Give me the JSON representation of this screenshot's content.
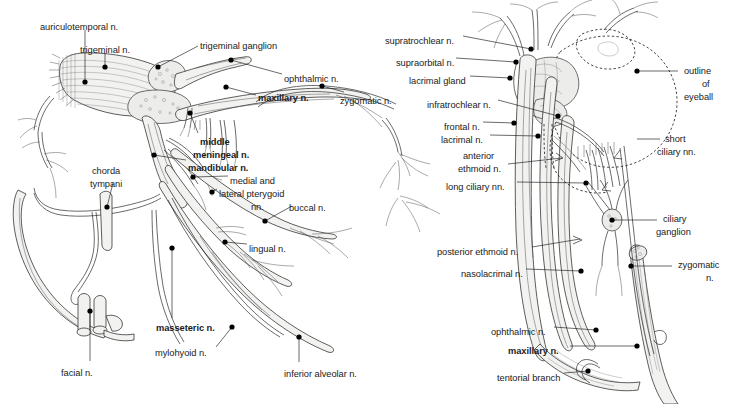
{
  "figure": {
    "background_color": "#ffffff",
    "ink_color": "#1a1a1a",
    "nerve_fill_color": "#f2f2f0",
    "panels": [
      {
        "id": "left",
        "name": "trigeminal-nerve-panel"
      },
      {
        "id": "right",
        "name": "orbit-ophthalmic-panel"
      }
    ]
  },
  "left_panel": {
    "name": "trigeminal-nerve-panel",
    "labels": [
      {
        "id": "auriculotemporal",
        "text": "auriculotemporal n.",
        "bold": false,
        "x": 40,
        "y": 22,
        "align": "left",
        "dot": [
          85,
          82
        ]
      },
      {
        "id": "trigeminal",
        "text": "trigeminal n.",
        "bold": false,
        "x": 80,
        "y": 45,
        "align": "left",
        "dot": [
          105,
          67
        ]
      },
      {
        "id": "trigeminal_gang",
        "text": "trigeminal ganglion",
        "bold": false,
        "x": 200,
        "y": 41,
        "align": "left",
        "dot": [
          158,
          67
        ]
      },
      {
        "id": "ophthalmic_l",
        "text": "ophthalmic n.",
        "bold": false,
        "x": 284,
        "y": 74,
        "align": "left",
        "dot": [
          231,
          60
        ]
      },
      {
        "id": "maxillary_l",
        "text": "maxillary n.",
        "bold": true,
        "x": 258,
        "y": 93,
        "align": "left",
        "dot": [
          226,
          87
        ]
      },
      {
        "id": "zygomatic_l",
        "text": "zygomatic n.",
        "bold": false,
        "x": 340,
        "y": 96,
        "align": "left",
        "dot": [
          322,
          86
        ]
      },
      {
        "id": "middle",
        "text": "middle",
        "bold": true,
        "x": 200,
        "y": 137,
        "align": "left",
        "dot": [
          190,
          113
        ]
      },
      {
        "id": "meningeal",
        "text": "meningeal n.",
        "bold": true,
        "x": 193,
        "y": 150,
        "align": "left",
        "dot": null
      },
      {
        "id": "mandibular",
        "text": "mandibular n.",
        "bold": true,
        "x": 188,
        "y": 163,
        "align": "left",
        "dot": [
          154,
          155
        ]
      },
      {
        "id": "medial_and",
        "text": "medial and",
        "bold": false,
        "x": 230,
        "y": 176,
        "align": "left",
        "dot": [
          193,
          177
        ]
      },
      {
        "id": "lateral_pteryg",
        "text": "lateral pterygoid",
        "bold": false,
        "x": 219,
        "y": 189,
        "align": "left",
        "dot": [
          212,
          192
        ]
      },
      {
        "id": "nn",
        "text": "nn.",
        "bold": false,
        "x": 251,
        "y": 202,
        "align": "left",
        "dot": null
      },
      {
        "id": "buccal",
        "text": "buccal n.",
        "bold": false,
        "x": 289,
        "y": 203,
        "align": "left",
        "dot": [
          265,
          221
        ]
      },
      {
        "id": "chorda",
        "text": "chorda",
        "bold": false,
        "x": 92,
        "y": 166,
        "align": "left",
        "dot": [
          107,
          207
        ]
      },
      {
        "id": "tympani",
        "text": "tympani",
        "bold": false,
        "x": 90,
        "y": 179,
        "align": "left",
        "dot": null
      },
      {
        "id": "lingual",
        "text": "lingual n.",
        "bold": false,
        "x": 249,
        "y": 244,
        "align": "left",
        "dot": [
          225,
          242
        ]
      },
      {
        "id": "masseteric",
        "text": "masseteric n.",
        "bold": true,
        "x": 156,
        "y": 323,
        "align": "left",
        "dot": [
          172,
          248
        ]
      },
      {
        "id": "mylohyoid",
        "text": "mylohyoid n.",
        "bold": false,
        "x": 155,
        "y": 348,
        "align": "left",
        "dot": [
          232,
          327
        ]
      },
      {
        "id": "facial",
        "text": "facial n.",
        "bold": false,
        "x": 61,
        "y": 368,
        "align": "left",
        "dot": [
          90,
          311
        ]
      },
      {
        "id": "inferior_alv",
        "text": "inferior alveolar n.",
        "bold": false,
        "x": 284,
        "y": 369,
        "align": "left",
        "dot": [
          299,
          337
        ]
      }
    ]
  },
  "right_panel": {
    "name": "orbit-ophthalmic-panel",
    "labels": [
      {
        "id": "supratrochlear",
        "text": "supratrochlear n.",
        "bold": false,
        "x": 385,
        "y": 36,
        "align": "left",
        "dot": [
          531,
          49
        ]
      },
      {
        "id": "supraorbital",
        "text": "supraorbital n.",
        "bold": false,
        "x": 396,
        "y": 58,
        "align": "left",
        "dot": [
          516,
          62
        ]
      },
      {
        "id": "lacrimal_gland",
        "text": "lacrimal gland",
        "bold": false,
        "x": 409,
        "y": 76,
        "align": "left",
        "dot": [
          510,
          78
        ]
      },
      {
        "id": "infratrochlear",
        "text": "infratrochlear n.",
        "bold": false,
        "x": 427,
        "y": 100,
        "align": "left",
        "dot": [
          558,
          116
        ]
      },
      {
        "id": "frontal",
        "text": "frontal n.",
        "bold": false,
        "x": 444,
        "y": 122,
        "align": "left",
        "dot": [
          514,
          123
        ]
      },
      {
        "id": "lacrimal_n",
        "text": "lacrimal n.",
        "bold": false,
        "x": 441,
        "y": 135,
        "align": "left",
        "dot": [
          538,
          136
        ]
      },
      {
        "id": "anterior",
        "text": "anterior",
        "bold": false,
        "x": 463,
        "y": 151,
        "align": "left",
        "dot": null
      },
      {
        "id": "ethmoid",
        "text": "ethmoid n.",
        "bold": false,
        "x": 458,
        "y": 164,
        "align": "left",
        "dot": null
      },
      {
        "id": "long_ciliary",
        "text": "long ciliary nn.",
        "bold": false,
        "x": 446,
        "y": 182,
        "align": "left",
        "dot": [
          586,
          183
        ]
      },
      {
        "id": "posterior_eth",
        "text": "posterior ethmoid n.",
        "bold": false,
        "x": 437,
        "y": 247,
        "align": "left",
        "dot": null
      },
      {
        "id": "nasolacrimal",
        "text": "nasolacrimal n.",
        "bold": false,
        "x": 461,
        "y": 269,
        "align": "left",
        "dot": [
          581,
          271
        ]
      },
      {
        "id": "ophthalmic_r",
        "text": "ophthalmic n.",
        "bold": false,
        "x": 491,
        "y": 327,
        "align": "left",
        "dot": [
          596,
          330
        ]
      },
      {
        "id": "maxillary_r",
        "text": "maxillary n.",
        "bold": true,
        "x": 508,
        "y": 346,
        "align": "left",
        "dot": [
          637,
          346
        ]
      },
      {
        "id": "tentorial",
        "text": "tentorial branch",
        "bold": false,
        "x": 497,
        "y": 373,
        "align": "left",
        "dot": [
          588,
          371
        ]
      },
      {
        "id": "outline",
        "text": "outline",
        "bold": false,
        "x": 684,
        "y": 68,
        "align": "left",
        "dot": [
          637,
          71
        ]
      },
      {
        "id": "of",
        "text": "of",
        "bold": false,
        "x": 702,
        "y": 81,
        "align": "left",
        "dot": null
      },
      {
        "id": "eyeball",
        "text": "eyeball",
        "bold": false,
        "x": 684,
        "y": 94,
        "align": "left",
        "dot": null
      },
      {
        "id": "short",
        "text": "short",
        "bold": false,
        "x": 665,
        "y": 136,
        "align": "left",
        "dot": null
      },
      {
        "id": "ciliary_nn",
        "text": "ciliary nn.",
        "bold": false,
        "x": 657,
        "y": 149,
        "align": "left",
        "dot": null
      },
      {
        "id": "ciliary_gang1",
        "text": "ciliary",
        "bold": false,
        "x": 663,
        "y": 218,
        "align": "left",
        "dot": [
          612,
          220
        ]
      },
      {
        "id": "ciliary_gang2",
        "text": "ganglion",
        "bold": false,
        "x": 656,
        "y": 231,
        "align": "left",
        "dot": null
      },
      {
        "id": "zygomatic_r",
        "text": "zygomatic",
        "bold": false,
        "x": 678,
        "y": 264,
        "align": "left",
        "dot": [
          631,
          266
        ]
      },
      {
        "id": "zygomatic_r2",
        "text": "n.",
        "bold": false,
        "x": 706,
        "y": 277,
        "align": "left",
        "dot": null
      }
    ]
  }
}
